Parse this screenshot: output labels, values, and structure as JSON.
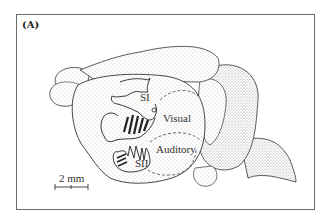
{
  "figure": {
    "panel_label": "(A)",
    "regions": [
      {
        "label": "SI"
      },
      {
        "label": "Visual"
      },
      {
        "label": "Auditory"
      },
      {
        "label": "SII"
      }
    ],
    "scale_bar": {
      "label": "2 mm"
    }
  }
}
